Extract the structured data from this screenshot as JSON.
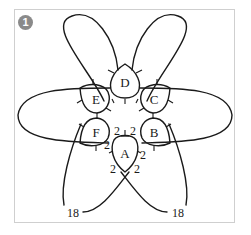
{
  "figure": {
    "badge_number": "1",
    "badge_color": "#8a8a8a",
    "frame_border_color": "#cfcfcf",
    "line_color": "#1a1a1a"
  },
  "rings": [
    {
      "id": "ring-a",
      "label": "A"
    },
    {
      "id": "ring-b",
      "label": "B"
    },
    {
      "id": "ring-c",
      "label": "C"
    },
    {
      "id": "ring-d",
      "label": "D"
    },
    {
      "id": "ring-e",
      "label": "E"
    },
    {
      "id": "ring-f",
      "label": "F"
    }
  ],
  "stitch_counts": {
    "a_top_left": "2",
    "a_top_right": "2",
    "a_left_upper": "2",
    "a_right_upper": "2",
    "a_left_lower": "2",
    "a_right_lower": "2"
  },
  "chain_ends": {
    "left": "18",
    "right": "18"
  }
}
